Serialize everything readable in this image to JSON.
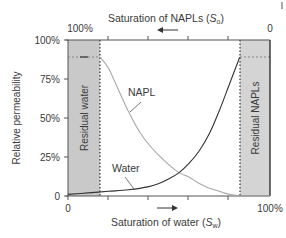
{
  "chart_data": {
    "type": "line",
    "title": "",
    "xlabel": "Saturation of water (S_w)",
    "xlabel_main": "Saturation of water (",
    "xlabel_sym": "S",
    "xlabel_sub": "w",
    "x2label_main": "Saturation of NAPLs (",
    "x2label_sym": "S",
    "x2label_sub": "o",
    "ylabel": "Relative permeability",
    "x_ticks": {
      "left": "0",
      "right": "100%"
    },
    "x2_ticks": {
      "left": "100%",
      "right": "0"
    },
    "y_ticks": [
      "0",
      "25%",
      "50%",
      "75%",
      "100%"
    ],
    "ylim": [
      0,
      100
    ],
    "xlim": [
      0,
      100
    ],
    "grid": false,
    "shaded_regions": [
      {
        "label": "Residual water",
        "x_range": [
          0,
          16
        ],
        "color": "#c9c9c9"
      },
      {
        "label": "Residual NAPLs",
        "x_range": [
          85,
          100
        ],
        "color": "#d4d4d4"
      }
    ],
    "max_rel_perm_dashed": 89,
    "series": [
      {
        "name": "NAPL",
        "color": "#a8a8a8",
        "x": [
          16,
          20,
          25,
          30,
          35,
          40,
          45,
          50,
          55,
          60,
          65,
          70,
          75,
          80,
          85
        ],
        "y": [
          89,
          82,
          68,
          54,
          42,
          33,
          26,
          20,
          15,
          12,
          8,
          5,
          3,
          1,
          0
        ]
      },
      {
        "name": "Water",
        "color": "#333333",
        "x": [
          0,
          10,
          20,
          30,
          40,
          45,
          50,
          55,
          60,
          65,
          70,
          75,
          80,
          85
        ],
        "y": [
          1,
          2,
          3,
          4,
          6,
          8,
          11,
          15,
          21,
          29,
          40,
          55,
          72,
          89
        ]
      }
    ],
    "annotations": [
      "NAPL",
      "Water",
      "Residual water",
      "Residual NAPLs"
    ],
    "arrows": {
      "top": "left",
      "bottom": "right"
    }
  }
}
